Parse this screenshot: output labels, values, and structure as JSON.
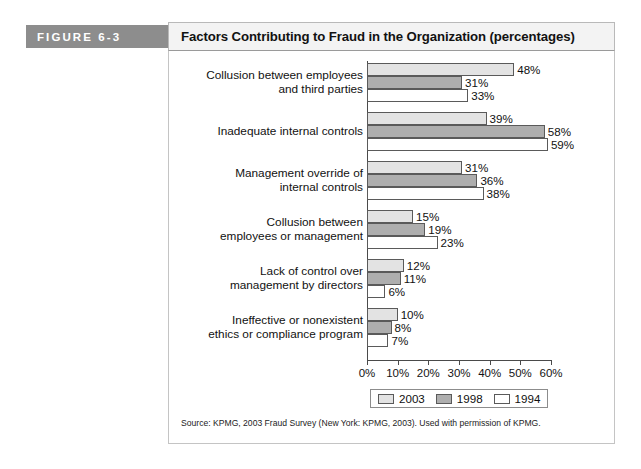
{
  "figure": {
    "label": "FIGURE 6-3",
    "title": "Factors Contributing to Fraud in the Organization (percentages)",
    "source": "Source: KPMG, 2003 Fraud Survey (New York: KPMG, 2003). Used with permission of KPMG."
  },
  "legend": [
    {
      "label": "2003",
      "color": "#e3e3e3"
    },
    {
      "label": "1998",
      "color": "#aeaeae"
    },
    {
      "label": "1994",
      "color": "#ffffff"
    }
  ],
  "axis": {
    "ticks": [
      "0%",
      "10%",
      "20%",
      "30%",
      "40%",
      "50%",
      "60%"
    ]
  },
  "chart_data": {
    "type": "bar",
    "orientation": "horizontal",
    "title": "Factors Contributing to Fraud in the Organization (percentages)",
    "xlabel": "",
    "ylabel": "",
    "xlim": [
      0,
      60
    ],
    "xticks": [
      0,
      10,
      20,
      30,
      40,
      50,
      60
    ],
    "xtick_labels": [
      "0%",
      "10%",
      "20%",
      "30%",
      "40%",
      "50%",
      "60%"
    ],
    "grid": false,
    "legend_position": "bottom",
    "categories": [
      "Collusion between employees\nand third parties",
      "Inadequate internal controls",
      "Management override of\ninternal controls",
      "Collusion between\nemployees or management",
      "Lack of control over\nmanagement by directors",
      "Ineffective or nonexistent\nethics or compliance program"
    ],
    "series": [
      {
        "name": "2003",
        "color": "#e3e3e3",
        "values": [
          48,
          39,
          31,
          15,
          12,
          10
        ],
        "labels": [
          "48%",
          "39%",
          "31%",
          "15%",
          "12%",
          "10%"
        ]
      },
      {
        "name": "1998",
        "color": "#aeaeae",
        "values": [
          31,
          58,
          36,
          19,
          11,
          8
        ],
        "labels": [
          "31%",
          "58%",
          "36%",
          "19%",
          "11%",
          "8%"
        ]
      },
      {
        "name": "1994",
        "color": "#ffffff",
        "values": [
          33,
          59,
          38,
          23,
          6,
          7
        ],
        "labels": [
          "33%",
          "59%",
          "38%",
          "23%",
          "6%",
          "7%"
        ]
      }
    ],
    "source": "Source: KPMG, 2003 Fraud Survey (New York: KPMG, 2003). Used with permission of KPMG."
  }
}
